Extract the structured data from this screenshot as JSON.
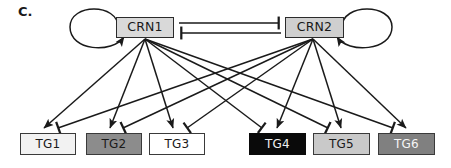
{
  "figure": {
    "panel_label": "C.",
    "type": "regulatory-network-diagram",
    "background_color": "#ffffff",
    "width": 451,
    "height": 168
  },
  "regulators": [
    {
      "id": "crn1",
      "label": "CRN1",
      "fill_color": "#d9d9d9",
      "text_color": "#1a1a1a",
      "border_color": "#2b2b2b",
      "x": 116,
      "y": 17,
      "width": 58,
      "height": 21,
      "self_loop": {
        "name": "self-activation-loop",
        "edge_type": "activation",
        "side": "left"
      }
    },
    {
      "id": "crn2",
      "label": "CRN2",
      "fill_color": "#cfcfcf",
      "text_color": "#1a1a1a",
      "border_color": "#2b2b2b",
      "x": 285,
      "y": 17,
      "width": 59,
      "height": 21,
      "self_loop": {
        "name": "self-activation-loop",
        "edge_type": "activation",
        "side": "right"
      }
    }
  ],
  "mutual_edges": [
    {
      "name": "crn1-inhibits-crn2",
      "from": "crn1",
      "to": "crn2",
      "edge_type": "inhibition",
      "x1": 179,
      "y1": 23,
      "x2": 281,
      "y2": 23
    },
    {
      "name": "crn2-inhibits-crn1",
      "from": "crn2",
      "to": "crn1",
      "edge_type": "inhibition",
      "x1": 281,
      "y1": 33,
      "x2": 179,
      "y2": 33
    }
  ],
  "targets": [
    {
      "id": "tg1",
      "label": "TG1",
      "fill_color": "#f2f2f2",
      "text_color": "#1a1a1a",
      "border_color": "#3a3a3a",
      "x": 20,
      "y": 133,
      "width": 56,
      "height": 22
    },
    {
      "id": "tg2",
      "label": "TG2",
      "fill_color": "#8c8c8c",
      "text_color": "#1a1a1a",
      "border_color": "#3a3a3a",
      "x": 86,
      "y": 133,
      "width": 56,
      "height": 22
    },
    {
      "id": "tg3",
      "label": "TG3",
      "fill_color": "#ffffff",
      "text_color": "#1a1a1a",
      "border_color": "#3a3a3a",
      "x": 149,
      "y": 133,
      "width": 56,
      "height": 22
    },
    {
      "id": "tg4",
      "label": "TG4",
      "fill_color": "#0a0a0a",
      "text_color": "#f0f0f0",
      "border_color": "#0a0a0a",
      "x": 249,
      "y": 133,
      "width": 57,
      "height": 22
    },
    {
      "id": "tg5",
      "label": "TG5",
      "fill_color": "#c9c9c9",
      "text_color": "#1a1a1a",
      "border_color": "#3a3a3a",
      "x": 313,
      "y": 133,
      "width": 57,
      "height": 22
    },
    {
      "id": "tg6",
      "label": "TG6",
      "fill_color": "#808080",
      "text_color": "#f5f5f5",
      "border_color": "#3a3a3a",
      "x": 378,
      "y": 133,
      "width": 57,
      "height": 22
    }
  ],
  "target_edges": [
    {
      "name": "crn1-activates-tg1",
      "from": "crn1",
      "to": "tg1",
      "edge_type": "activation",
      "x1": 145,
      "y1": 39,
      "x2": 44,
      "y2": 129
    },
    {
      "name": "crn1-activates-tg2",
      "from": "crn1",
      "to": "tg2",
      "edge_type": "activation",
      "x1": 145,
      "y1": 39,
      "x2": 110,
      "y2": 129
    },
    {
      "name": "crn1-activates-tg3",
      "from": "crn1",
      "to": "tg3",
      "edge_type": "activation",
      "x1": 145,
      "y1": 39,
      "x2": 173,
      "y2": 129
    },
    {
      "name": "crn1-inhibits-tg4",
      "from": "crn1",
      "to": "tg4",
      "edge_type": "inhibition",
      "x1": 145,
      "y1": 39,
      "x2": 262,
      "y2": 129
    },
    {
      "name": "crn1-inhibits-tg5",
      "from": "crn1",
      "to": "tg5",
      "edge_type": "inhibition",
      "x1": 145,
      "y1": 39,
      "x2": 328,
      "y2": 129
    },
    {
      "name": "crn1-inhibits-tg6",
      "from": "crn1",
      "to": "tg6",
      "edge_type": "inhibition",
      "x1": 145,
      "y1": 39,
      "x2": 393,
      "y2": 129
    },
    {
      "name": "crn2-inhibits-tg1",
      "from": "crn2",
      "to": "tg1",
      "edge_type": "inhibition",
      "x1": 313,
      "y1": 39,
      "x2": 58,
      "y2": 129
    },
    {
      "name": "crn2-inhibits-tg2",
      "from": "crn2",
      "to": "tg2",
      "edge_type": "inhibition",
      "x1": 313,
      "y1": 39,
      "x2": 123,
      "y2": 129
    },
    {
      "name": "crn2-inhibits-tg3",
      "from": "crn2",
      "to": "tg3",
      "edge_type": "inhibition",
      "x1": 313,
      "y1": 39,
      "x2": 187,
      "y2": 129
    },
    {
      "name": "crn2-activates-tg4",
      "from": "crn2",
      "to": "tg4",
      "edge_type": "activation",
      "x1": 313,
      "y1": 39,
      "x2": 277,
      "y2": 129
    },
    {
      "name": "crn2-activates-tg5",
      "from": "crn2",
      "to": "tg5",
      "edge_type": "activation",
      "x1": 313,
      "y1": 39,
      "x2": 341,
      "y2": 129
    },
    {
      "name": "crn2-activates-tg6",
      "from": "crn2",
      "to": "tg6",
      "edge_type": "activation",
      "x1": 313,
      "y1": 39,
      "x2": 406,
      "y2": 129
    }
  ],
  "edge_style": {
    "stroke_color": "#1a1a1a",
    "stroke_width": 1.5,
    "arrow_name": "activation-arrowhead",
    "bar_name": "inhibition-tbar"
  }
}
